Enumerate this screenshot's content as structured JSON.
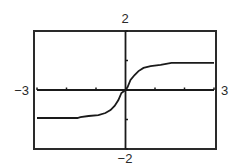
{
  "chart_data": {
    "type": "line",
    "title": "",
    "xlabel": "",
    "ylabel": "",
    "xlim": [
      -3,
      3
    ],
    "ylim": [
      -2,
      2
    ],
    "grid": false,
    "legend": null,
    "window_labels": {
      "xmin": "−3",
      "xmax": "3",
      "ymin": "−2",
      "ymax": "2"
    },
    "x_ticks": [
      -3,
      -2,
      -1,
      0,
      1,
      2,
      3
    ],
    "y_ticks": [
      -2,
      -1,
      0,
      1,
      2
    ],
    "series": [
      {
        "name": "f(x)",
        "color": "#1a1a1a",
        "x": [
          -3,
          -1.63,
          -1.53,
          -1.25,
          -0.92,
          -0.68,
          -0.51,
          -0.37,
          -0.24,
          -0.14,
          0,
          0.07,
          0.17,
          0.31,
          0.44,
          0.61,
          0.85,
          1.19,
          1.56,
          3
        ],
        "y": [
          -0.95,
          -0.95,
          -0.92,
          -0.88,
          -0.85,
          -0.78,
          -0.68,
          -0.54,
          -0.34,
          -0.1,
          0,
          0.1,
          0.34,
          0.51,
          0.64,
          0.75,
          0.81,
          0.85,
          0.92,
          0.92
        ]
      }
    ]
  },
  "colors": {
    "frame": "#2a2a2a",
    "axis": "#1a1a1a",
    "curve": "#1a1a1a",
    "background": "#ffffff"
  }
}
